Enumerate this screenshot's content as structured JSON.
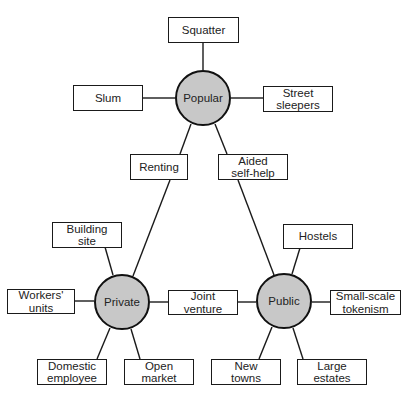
{
  "diagram": {
    "hubs": {
      "popular": {
        "label": "Popular",
        "fill": "#c8c8c8"
      },
      "private": {
        "label": "Private",
        "fill": "#c8c8c8"
      },
      "public": {
        "label": "Public",
        "fill": "#c8c8c8"
      }
    },
    "nodes": {
      "squatter": "Squatter",
      "slum": "Slum",
      "street_sleepers": "Street\nsleepers",
      "renting": "Renting",
      "aided_self_help": "Aided\nself-help",
      "building_site": "Building\nsite",
      "workers_units": "Workers'\nunits",
      "joint_venture": "Joint\nventure",
      "hostels": "Hostels",
      "small_scale_tokenism": "Small-scale\ntokenism",
      "domestic_employee": "Domestic\nemployee",
      "open_market": "Open\nmarket",
      "new_towns": "New\ntowns",
      "large_estates": "Large\nestates"
    },
    "edges": [
      [
        "popular",
        "squatter"
      ],
      [
        "popular",
        "slum"
      ],
      [
        "popular",
        "street_sleepers"
      ],
      [
        "popular",
        "renting"
      ],
      [
        "renting",
        "private"
      ],
      [
        "popular",
        "aided_self_help"
      ],
      [
        "aided_self_help",
        "public"
      ],
      [
        "private",
        "building_site"
      ],
      [
        "private",
        "workers_units"
      ],
      [
        "private",
        "joint_venture"
      ],
      [
        "joint_venture",
        "public"
      ],
      [
        "private",
        "domestic_employee"
      ],
      [
        "private",
        "open_market"
      ],
      [
        "public",
        "hostels"
      ],
      [
        "public",
        "small_scale_tokenism"
      ],
      [
        "public",
        "new_towns"
      ],
      [
        "public",
        "large_estates"
      ]
    ]
  }
}
